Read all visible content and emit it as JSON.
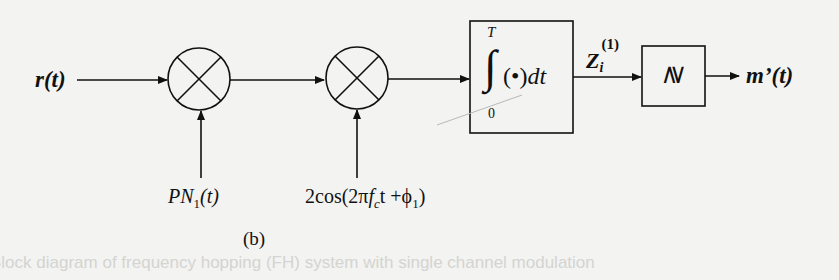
{
  "diagram": {
    "input_label": "r(t)",
    "multiplier1": {
      "symbol": "times",
      "input_label_base": "PN",
      "input_label_sub": "1",
      "input_label_tail": "(t)"
    },
    "multiplier2": {
      "symbol": "times",
      "input_label_prefix": "2cos(2π",
      "input_label_f": "f",
      "input_label_fsub": "c",
      "input_label_mid": "t +ϕ",
      "input_label_phisub": "1",
      "input_label_close": ")"
    },
    "integrator": {
      "upper_limit": "T",
      "lower_limit": "0",
      "body": "(•)",
      "dt": "dt"
    },
    "integrator_output": {
      "base": "Z",
      "sub": "i",
      "sup": "(1)"
    },
    "decision": {
      "symbol": "≷"
    },
    "output_label": "m’(t)",
    "caption": "(b)"
  },
  "background_bleed": {
    "caption_text": "Block diagram of frequency hopping (FH) system with single channel modulation"
  },
  "colors": {
    "stroke": "#111111",
    "background": "#f3f3f1"
  }
}
